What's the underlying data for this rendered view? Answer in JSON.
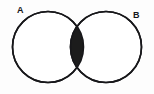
{
  "figure": {
    "type": "venn-diagram",
    "background_color": "#fdfdfd",
    "stroke_color": "#17171a",
    "fill_color": "#ffffff",
    "shaded_color": "#1c1c1c",
    "stroke_width": 1.6
  },
  "labels": {
    "set_a": "A",
    "set_b": "B"
  },
  "sets": [
    {
      "name": "A",
      "label": "A",
      "cx": 48,
      "cy": 47,
      "r": 35.5,
      "filled": false
    },
    {
      "name": "B",
      "label": "B",
      "cx": 106,
      "cy": 47,
      "r": 35.5,
      "filled": false
    }
  ],
  "shaded_region": {
    "name": "intersection",
    "notation": "A ∩ B",
    "filled": true,
    "color": "#1c1c1c",
    "top_crossing": {
      "x": 77,
      "y": 20
    },
    "bottom_crossing": {
      "x": 77,
      "y": 74
    },
    "left_extent": 63,
    "right_extent": 92
  }
}
